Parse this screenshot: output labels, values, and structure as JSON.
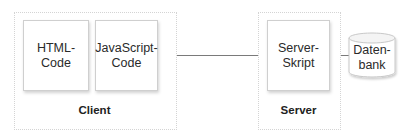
{
  "diagram": {
    "client": {
      "label": "Client",
      "html_box": "HTML-\nCode",
      "js_box": "JavaScript-\nCode"
    },
    "server": {
      "label": "Server",
      "script_box": "Server-\nSkript"
    },
    "database": {
      "label": "Daten-\nbank",
      "icon": "database-cylinder-icon"
    },
    "colors": {
      "connector": "#7a7a7a",
      "border": "#cfcfcf",
      "container_border": "#d4d4d4"
    }
  }
}
